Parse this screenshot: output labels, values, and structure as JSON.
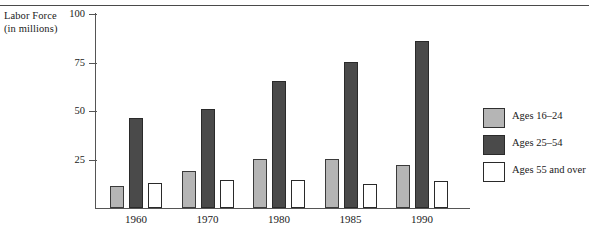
{
  "chart_data": {
    "type": "bar",
    "title": "",
    "ylabel": "Labor Force (in millions)",
    "ylabel_line1": "Labor Force",
    "ylabel_line2": "(in millions)",
    "xlabel": "",
    "categories": [
      "1960",
      "1970",
      "1980",
      "1985",
      "1990"
    ],
    "ylim": [
      0,
      100
    ],
    "yticks": [
      100,
      75,
      50,
      25
    ],
    "ytick_labels": [
      "100",
      "75",
      "50",
      "25"
    ],
    "grid": false,
    "legend_position": "right",
    "series": [
      {
        "name": "Ages 16–24",
        "color": "#b5b5b5",
        "values": [
          11.5,
          19,
          25.5,
          25.5,
          22
        ]
      },
      {
        "name": "Ages 25–54",
        "color": "#4a4a4a",
        "values": [
          46.5,
          51,
          65.5,
          75.5,
          86
        ]
      },
      {
        "name": "Ages 55 and over",
        "color": "#ffffff",
        "values": [
          13,
          14.5,
          14.5,
          12.5,
          14
        ]
      }
    ]
  },
  "legend": {
    "items": [
      {
        "label": "Ages 16–24"
      },
      {
        "label": "Ages 25–54"
      },
      {
        "label": "Ages 55 and over"
      }
    ]
  }
}
